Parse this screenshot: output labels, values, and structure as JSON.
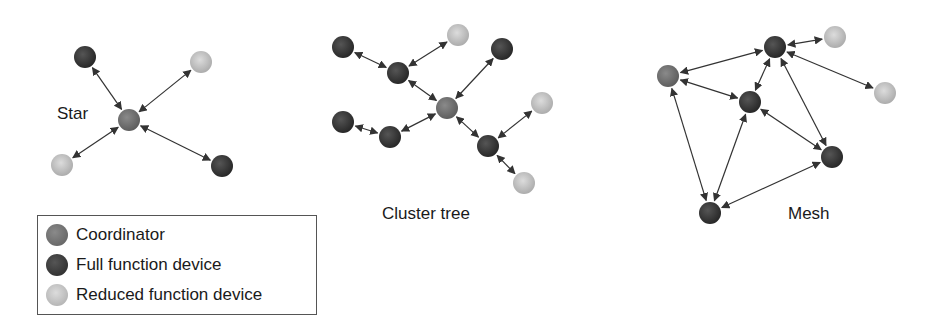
{
  "colors": {
    "coordinator": "#6e6e6e",
    "full_function_device": "#3a3a3a",
    "reduced_function_device": "#c4c4c4",
    "edge": "#333333"
  },
  "topologies": [
    {
      "name": "star",
      "label": "Star",
      "label_pos": [
        57,
        113
      ],
      "nodes": [
        {
          "id": "c",
          "type": "coordinator",
          "x": 129,
          "y": 120
        },
        {
          "id": "f1",
          "type": "full_function_device",
          "x": 85,
          "y": 57
        },
        {
          "id": "r1",
          "type": "reduced_function_device",
          "x": 201,
          "y": 62
        },
        {
          "id": "r2",
          "type": "reduced_function_device",
          "x": 62,
          "y": 165
        },
        {
          "id": "f2",
          "type": "full_function_device",
          "x": 222,
          "y": 166
        }
      ],
      "edges": [
        [
          "c",
          "f1"
        ],
        [
          "c",
          "r1"
        ],
        [
          "c",
          "r2"
        ],
        [
          "c",
          "f2"
        ]
      ]
    },
    {
      "name": "cluster-tree",
      "label": "Cluster tree",
      "label_pos": [
        382,
        213
      ],
      "nodes": [
        {
          "id": "a",
          "type": "full_function_device",
          "x": 343,
          "y": 47
        },
        {
          "id": "b",
          "type": "full_function_device",
          "x": 398,
          "y": 73
        },
        {
          "id": "c",
          "type": "reduced_function_device",
          "x": 458,
          "y": 35
        },
        {
          "id": "d",
          "type": "full_function_device",
          "x": 502,
          "y": 49
        },
        {
          "id": "e",
          "type": "coordinator",
          "x": 447,
          "y": 108
        },
        {
          "id": "f",
          "type": "reduced_function_device",
          "x": 542,
          "y": 103
        },
        {
          "id": "g",
          "type": "full_function_device",
          "x": 343,
          "y": 122
        },
        {
          "id": "h",
          "type": "full_function_device",
          "x": 390,
          "y": 137
        },
        {
          "id": "i",
          "type": "full_function_device",
          "x": 488,
          "y": 146
        },
        {
          "id": "j",
          "type": "reduced_function_device",
          "x": 524,
          "y": 183
        }
      ],
      "edges": [
        [
          "a",
          "b"
        ],
        [
          "b",
          "c"
        ],
        [
          "b",
          "e"
        ],
        [
          "e",
          "d"
        ],
        [
          "g",
          "h"
        ],
        [
          "h",
          "e"
        ],
        [
          "e",
          "i"
        ],
        [
          "i",
          "f"
        ],
        [
          "i",
          "j"
        ]
      ]
    },
    {
      "name": "mesh",
      "label": "Mesh",
      "label_pos": [
        788,
        205
      ],
      "nodes": [
        {
          "id": "a",
          "type": "coordinator",
          "x": 668,
          "y": 76
        },
        {
          "id": "b",
          "type": "full_function_device",
          "x": 775,
          "y": 47
        },
        {
          "id": "c",
          "type": "reduced_function_device",
          "x": 835,
          "y": 37
        },
        {
          "id": "d",
          "type": "full_function_device",
          "x": 750,
          "y": 102
        },
        {
          "id": "e",
          "type": "reduced_function_device",
          "x": 885,
          "y": 93
        },
        {
          "id": "f",
          "type": "full_function_device",
          "x": 832,
          "y": 157
        },
        {
          "id": "g",
          "type": "full_function_device",
          "x": 710,
          "y": 213
        }
      ],
      "edges": [
        [
          "a",
          "b"
        ],
        [
          "a",
          "d"
        ],
        [
          "a",
          "g"
        ],
        [
          "b",
          "c"
        ],
        [
          "b",
          "e"
        ],
        [
          "b",
          "d"
        ],
        [
          "b",
          "f"
        ],
        [
          "d",
          "f"
        ],
        [
          "d",
          "g"
        ],
        [
          "g",
          "f"
        ]
      ]
    }
  ],
  "legend": {
    "items": [
      {
        "type": "coordinator",
        "label": "Coordinator"
      },
      {
        "type": "full_function_device",
        "label": "Full function device"
      },
      {
        "type": "reduced_function_device",
        "label": "Reduced function device"
      }
    ]
  }
}
